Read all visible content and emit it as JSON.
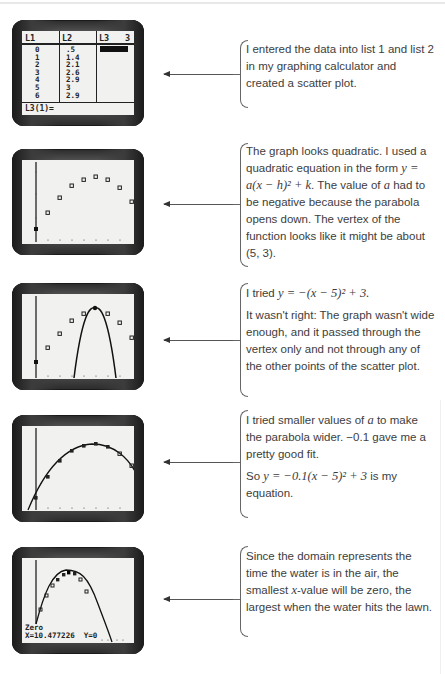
{
  "steps": [
    {
      "screen": {
        "type": "list-editor",
        "headers": [
          "L1",
          "L2",
          "L3",
          "3"
        ],
        "L1": [
          "0",
          "1",
          "2",
          "3",
          "4",
          "5",
          "6"
        ],
        "L2": [
          ".5",
          "1.4",
          "2.1",
          "2.6",
          "2.9",
          "3",
          "2.9"
        ],
        "footer": "L3(1)="
      },
      "note": {
        "paragraphs": [
          "I entered the data into list 1 and list 2 in my graphing calculator and created a scatter plot."
        ]
      }
    },
    {
      "screen": {
        "type": "scatter-plot"
      },
      "note": {
        "p1_a": "The graph looks quadratic. I used a quadratic equation in the form ",
        "p1_eq": "y = a(x − h)² + k",
        "p1_b": ". The value of ",
        "p1_var": "a",
        "p1_c": " had to be negative because the parabola opens down. The vertex of the function looks like it might be about (5, 3)."
      }
    },
    {
      "screen": {
        "type": "scatter-with-narrow-parabola",
        "equation": "y = -(x - 5)^2 + 3"
      },
      "note": {
        "p1_a": "I tried ",
        "p1_eq": "y = −(x − 5)² + 3.",
        "p2": "It wasn't right: The graph wasn't wide enough, and it passed through the vertex only and not through any of the other points of the scatter plot."
      }
    },
    {
      "screen": {
        "type": "scatter-with-fit-parabola",
        "equation": "y = -0.1(x - 5)^2 + 3"
      },
      "note": {
        "p1_a": "I tried smaller values of ",
        "p1_var": "a",
        "p1_b": " to make the parabola wider. −0.1 gave me a pretty good fit.",
        "p2_a": "So ",
        "p2_eq": "y = −0.1(x − 5)² + 3",
        "p2_b": " is my equation."
      }
    },
    {
      "screen": {
        "type": "zero-trace",
        "label": "Zero",
        "readout": "X=10.477226  Y=0"
      },
      "note": {
        "p1_a": "Since the domain represents the time the water is in the air, the smallest ",
        "p1_var": "x",
        "p1_b": "-value will be zero, the largest when the water hits the lawn."
      }
    }
  ],
  "colors": {
    "screen_bg": "#f1f1ef",
    "text": "#3d3d3d",
    "bracket": "#666666"
  }
}
